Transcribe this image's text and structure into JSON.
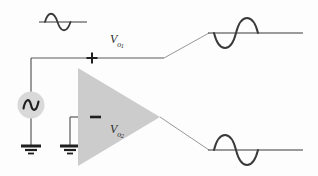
{
  "figure": {
    "background_color": "#fdfdfd",
    "line_color": "#3a3a3a",
    "amplifier_fill": "#cccccc",
    "source_fill": "#d9d9d9",
    "width": 318,
    "height": 176
  },
  "labels": {
    "output1": {
      "base": "V",
      "sub": "o",
      "sub2": "1",
      "full": "Vo1"
    },
    "output2": {
      "base": "V",
      "sub": "o",
      "sub2": "2",
      "full": "Vo2"
    },
    "plus_terminal": "+",
    "minus_terminal": "−"
  },
  "components": {
    "ac_source": {
      "name": "ac-voltage-source",
      "symbol": "sine-wave-in-circle",
      "cx": 31,
      "cy": 105,
      "r": 13
    },
    "amplifier": {
      "name": "op-amp-triangle",
      "points": "78,68 78,166 160,117",
      "orientation": "right"
    },
    "ground_source": {
      "name": "ground-symbol-source",
      "x": 31,
      "y": 146
    },
    "ground_inverting": {
      "name": "ground-symbol-inverting-input",
      "x": 70,
      "y": 146
    }
  },
  "waveforms": {
    "input": {
      "name": "input-sine-waveform",
      "axis_x1": 39,
      "axis_x2": 87,
      "axis_y": 22,
      "amplitude": 11,
      "phase": "positive-first",
      "description": "input signal: positive half-cycle first"
    },
    "output_top": {
      "name": "output1-sine-waveform",
      "axis_x1": 208,
      "axis_x2": 302,
      "axis_y": 33,
      "amplitude": 20,
      "phase": "negative-first",
      "description": "Vo1 output: inverted relative to input"
    },
    "output_bottom": {
      "name": "output2-sine-waveform",
      "axis_x1": 208,
      "axis_x2": 302,
      "axis_y": 150,
      "amplitude": 20,
      "phase": "positive-first",
      "description": "Vo2 output: in phase with input"
    }
  },
  "wires": {
    "source_to_plus": "from AC source top up to y=58 then right to + terminal",
    "plus_to_output1": "horizontal line at y=58 from x=96 to x=163",
    "ground_to_minus": "from inverting-input ground up to y=117 then right to − terminal",
    "leader_top": "diagonal leader from x=163,y=58 to x=208,y=33",
    "leader_bottom": "diagonal leader from x=160,y=117 to x=208,y=150"
  }
}
